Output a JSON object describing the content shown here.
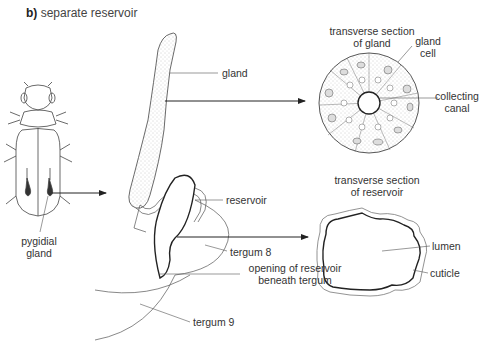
{
  "figure": {
    "panel_letter": "b)",
    "panel_title": "separate reservoir",
    "labels": {
      "gland": "gland",
      "reservoir": "reservoir",
      "tergum8": "tergum 8",
      "opening_line1": "opening of reservoir",
      "opening_line2": "beneath tergum",
      "tergum9": "tergum 9",
      "pygidial_line1": "pygidial",
      "pygidial_line2": "gland",
      "ts_gland_line1": "transverse section",
      "ts_gland_line2": "of gland",
      "gland_cell_line1": "gland",
      "gland_cell_line2": "cell",
      "collecting_line1": "collecting",
      "collecting_line2": "canal",
      "ts_res_line1": "transverse section",
      "ts_res_line2": "of reservoir",
      "lumen": "lumen",
      "cuticle": "cuticle"
    },
    "colors": {
      "line": "#222222",
      "thin_line": "#555555",
      "stipple": "#b8b8b8",
      "text": "#333333"
    }
  }
}
